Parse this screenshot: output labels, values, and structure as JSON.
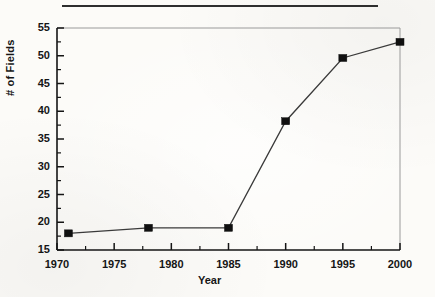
{
  "figure": {
    "background_color": "#fcfbf8",
    "ink_color": "#151515",
    "frame_color": "#9a9a9a",
    "top_rule": "horizontal-rule"
  },
  "chart_data": {
    "type": "line",
    "title": "",
    "subtitle": "",
    "xlabel": "Year",
    "ylabel": "# of Fields",
    "xlim": [
      1970,
      2000
    ],
    "ylim": [
      15,
      55
    ],
    "x_major_ticks": [
      1970,
      1975,
      1980,
      1985,
      1990,
      1995,
      2000
    ],
    "x_major_tick_labels": [
      "1970",
      "1975",
      "1980",
      "1985",
      "1990",
      "1995",
      "2000"
    ],
    "x_minor_ticks": [
      1972.5,
      1977.5,
      1982.5,
      1987.5,
      1992.5,
      1997.5
    ],
    "y_major_ticks": [
      15,
      20,
      25,
      30,
      35,
      40,
      45,
      50,
      55
    ],
    "y_major_tick_labels": [
      "15",
      "20",
      "25",
      "30",
      "35",
      "40",
      "45",
      "50",
      "55"
    ],
    "y_minor_ticks": [
      17.5,
      22.5,
      27.5,
      32.5,
      37.5,
      42.5,
      47.5,
      52.5
    ],
    "grid": false,
    "legend_position": "none",
    "marker": "filled-square",
    "line_color": "#3a3a3a",
    "marker_color": "#101010",
    "x": [
      1971,
      1978,
      1985,
      1990,
      1995,
      2000
    ],
    "values": [
      18,
      19,
      19,
      38.2,
      49.6,
      52.5
    ],
    "series": [
      {
        "name": "# of Fields",
        "points": [
          {
            "x": 1971,
            "y": 18
          },
          {
            "x": 1978,
            "y": 19
          },
          {
            "x": 1985,
            "y": 19
          },
          {
            "x": 1990,
            "y": 38.2
          },
          {
            "x": 1995,
            "y": 49.6
          },
          {
            "x": 2000,
            "y": 52.5
          }
        ]
      }
    ],
    "annotations": []
  }
}
